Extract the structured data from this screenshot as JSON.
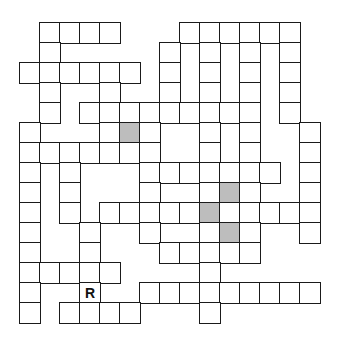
{
  "puzzle": {
    "type": "crossword",
    "rows": 15,
    "cols": 15,
    "cell_size_px": 20,
    "colors": {
      "border": "#1a1a1a",
      "cell": "#ffffff",
      "shaded": "#bdbdbd"
    },
    "cells": [
      [
        0,
        1
      ],
      [
        0,
        2
      ],
      [
        0,
        3
      ],
      [
        0,
        4
      ],
      [
        0,
        8
      ],
      [
        0,
        9
      ],
      [
        0,
        10
      ],
      [
        0,
        11
      ],
      [
        0,
        12
      ],
      [
        0,
        13
      ],
      [
        1,
        1
      ],
      [
        1,
        7
      ],
      [
        1,
        9
      ],
      [
        1,
        11
      ],
      [
        1,
        13
      ],
      [
        2,
        0
      ],
      [
        2,
        1
      ],
      [
        2,
        2
      ],
      [
        2,
        3
      ],
      [
        2,
        4
      ],
      [
        2,
        5
      ],
      [
        2,
        7
      ],
      [
        2,
        9
      ],
      [
        2,
        11
      ],
      [
        2,
        13
      ],
      [
        3,
        1
      ],
      [
        3,
        4
      ],
      [
        3,
        7
      ],
      [
        3,
        9
      ],
      [
        3,
        11
      ],
      [
        3,
        13
      ],
      [
        4,
        1
      ],
      [
        4,
        3
      ],
      [
        4,
        4
      ],
      [
        4,
        5
      ],
      [
        4,
        6
      ],
      [
        4,
        7
      ],
      [
        4,
        8
      ],
      [
        4,
        9
      ],
      [
        4,
        10
      ],
      [
        4,
        11
      ],
      [
        4,
        13
      ],
      [
        5,
        0
      ],
      [
        5,
        4
      ],
      [
        5,
        5
      ],
      [
        5,
        6
      ],
      [
        5,
        9
      ],
      [
        5,
        11
      ],
      [
        5,
        14
      ],
      [
        6,
        0
      ],
      [
        6,
        1
      ],
      [
        6,
        2
      ],
      [
        6,
        3
      ],
      [
        6,
        4
      ],
      [
        6,
        5
      ],
      [
        6,
        6
      ],
      [
        6,
        9
      ],
      [
        6,
        11
      ],
      [
        6,
        14
      ],
      [
        7,
        0
      ],
      [
        7,
        2
      ],
      [
        7,
        6
      ],
      [
        7,
        7
      ],
      [
        7,
        8
      ],
      [
        7,
        9
      ],
      [
        7,
        10
      ],
      [
        7,
        11
      ],
      [
        7,
        12
      ],
      [
        7,
        14
      ],
      [
        8,
        0
      ],
      [
        8,
        2
      ],
      [
        8,
        6
      ],
      [
        8,
        9
      ],
      [
        8,
        10
      ],
      [
        8,
        11
      ],
      [
        8,
        14
      ],
      [
        9,
        0
      ],
      [
        9,
        2
      ],
      [
        9,
        4
      ],
      [
        9,
        5
      ],
      [
        9,
        6
      ],
      [
        9,
        7
      ],
      [
        9,
        8
      ],
      [
        9,
        9
      ],
      [
        9,
        10
      ],
      [
        9,
        11
      ],
      [
        9,
        12
      ],
      [
        9,
        13
      ],
      [
        9,
        14
      ],
      [
        10,
        0
      ],
      [
        10,
        3
      ],
      [
        10,
        6
      ],
      [
        10,
        9
      ],
      [
        10,
        10
      ],
      [
        10,
        11
      ],
      [
        10,
        14
      ],
      [
        11,
        0
      ],
      [
        11,
        3
      ],
      [
        11,
        7
      ],
      [
        11,
        8
      ],
      [
        11,
        9
      ],
      [
        11,
        10
      ],
      [
        11,
        11
      ],
      [
        12,
        0
      ],
      [
        12,
        1
      ],
      [
        12,
        2
      ],
      [
        12,
        3
      ],
      [
        12,
        4
      ],
      [
        12,
        9
      ],
      [
        13,
        0
      ],
      [
        13,
        3
      ],
      [
        13,
        6
      ],
      [
        13,
        7
      ],
      [
        13,
        8
      ],
      [
        13,
        9
      ],
      [
        13,
        10
      ],
      [
        13,
        11
      ],
      [
        13,
        12
      ],
      [
        13,
        13
      ],
      [
        13,
        14
      ],
      [
        14,
        0
      ],
      [
        14,
        2
      ],
      [
        14,
        3
      ],
      [
        14,
        4
      ],
      [
        14,
        5
      ],
      [
        14,
        9
      ]
    ],
    "shaded": [
      [
        5,
        5
      ],
      [
        8,
        10
      ],
      [
        9,
        9
      ],
      [
        10,
        10
      ]
    ],
    "letters": [
      {
        "row": 13,
        "col": 3,
        "value": "R"
      }
    ]
  }
}
